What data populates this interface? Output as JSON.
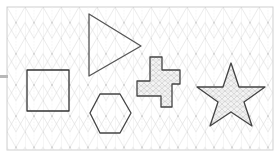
{
  "canvas": {
    "x": 7,
    "y": 7,
    "width": 266,
    "height": 143,
    "background": "#ffffff",
    "border_color": "#cfcfcf",
    "grid": {
      "type": "isometric",
      "color": "#d9d9d9",
      "spacing": 18
    }
  },
  "side_handle": {
    "color": "#b8b8b8"
  },
  "shapes": [
    {
      "name": "triangle",
      "stroke": "#555555",
      "fill": "none",
      "points": "89,14 141,46 89,76"
    },
    {
      "name": "square",
      "stroke": "#333333",
      "fill": "none",
      "points": "27,70 69,70 69,111 27,111"
    },
    {
      "name": "hexagon",
      "stroke": "#444444",
      "fill": "none",
      "points": "100,94 120,94 131,113 120,133 100,133 90,113"
    },
    {
      "name": "cross",
      "stroke": "#444444",
      "fill": "hatched",
      "points": "150,57 162,57 162,70 180,70 180,84 172,84 172,107 161,107 161,96 137,96 137,81 150,81"
    },
    {
      "name": "star",
      "stroke": "#444444",
      "fill": "hatched",
      "points": "231,63 239,87 265,87 244,102 252,126 231,112 210,126 218,102 197,87 223,87"
    }
  ]
}
